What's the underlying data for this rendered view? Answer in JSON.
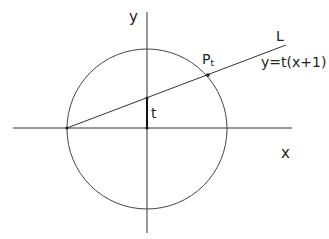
{
  "labels": {
    "y_axis": "y",
    "x_axis": "x",
    "line_name": "L",
    "line_equation": "y=t(x+1)",
    "point": "P",
    "point_sub": "t",
    "intercept": "t"
  },
  "colors": {
    "stroke": "#333333",
    "text": "#222222"
  }
}
